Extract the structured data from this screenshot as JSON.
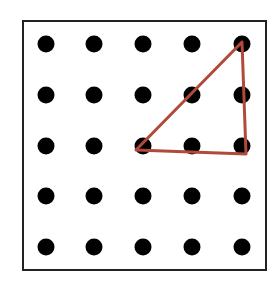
{
  "diagram": {
    "type": "geoboard-dot-grid",
    "frame": {
      "x": 23,
      "y": 21,
      "width": 243,
      "height": 249,
      "stroke": "#222222",
      "stroke_width": 2
    },
    "grid": {
      "rows": 5,
      "cols": 5,
      "x_positions": [
        46,
        94,
        143,
        192,
        242
      ],
      "y_positions": [
        44,
        95,
        146,
        196,
        247
      ],
      "dot_radius": 8.5,
      "dot_color": "#000000"
    },
    "shape": {
      "kind": "right-triangle",
      "stroke": "#b04a3a",
      "stroke_width": 3,
      "vertices_grid": [
        [
          0,
          4
        ],
        [
          2,
          2
        ],
        [
          2,
          4
        ]
      ],
      "vertices_px": [
        [
          242,
          42
        ],
        [
          136,
          150
        ],
        [
          246,
          154
        ]
      ],
      "description": "Right triangle through grid points (row0,col4), (row2,col2), (row2,col4)"
    }
  }
}
